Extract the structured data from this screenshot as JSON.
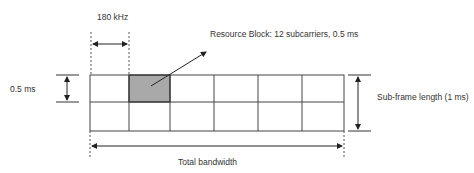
{
  "labels": {
    "subcarrier_width": "180 kHz",
    "resource_block": "Resource Block: 12 subcarriers, 0.5 ms",
    "slot_duration": "0.5 ms",
    "subframe_length": "Sub-frame length (1 ms)",
    "total_bandwidth": "Total bandwidth"
  },
  "grid": {
    "columns": 6,
    "rows": 2,
    "column_lines_x": [
      90,
      129,
      170,
      214,
      258,
      302,
      344
    ],
    "row_lines_y": [
      75,
      102,
      131
    ],
    "highlighted_cell": {
      "row": 0,
      "col": 1
    }
  },
  "colors": {
    "line": "#333333",
    "highlight_fill": "#a9a9a9",
    "text": "#333333",
    "background": "#ffffff"
  }
}
